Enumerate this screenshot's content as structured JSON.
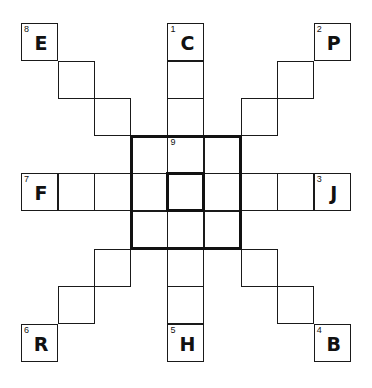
{
  "puzzle": {
    "type": "word-star grid",
    "grid_size": 9,
    "cells": [
      {
        "r": 0,
        "c": 0,
        "num": "8",
        "letter": "E"
      },
      {
        "r": 1,
        "c": 1
      },
      {
        "r": 2,
        "c": 2
      },
      {
        "r": 0,
        "c": 8,
        "num": "2",
        "letter": "P"
      },
      {
        "r": 1,
        "c": 7
      },
      {
        "r": 2,
        "c": 6
      },
      {
        "r": 6,
        "c": 2
      },
      {
        "r": 7,
        "c": 1
      },
      {
        "r": 8,
        "c": 0,
        "num": "6",
        "letter": "R"
      },
      {
        "r": 6,
        "c": 6
      },
      {
        "r": 7,
        "c": 7
      },
      {
        "r": 8,
        "c": 8,
        "num": "4",
        "letter": "B"
      },
      {
        "r": 0,
        "c": 4,
        "num": "1",
        "letter": "C"
      },
      {
        "r": 1,
        "c": 4
      },
      {
        "r": 2,
        "c": 4
      },
      {
        "r": 3,
        "c": 4,
        "num": "9"
      },
      {
        "r": 4,
        "c": 4
      },
      {
        "r": 5,
        "c": 4
      },
      {
        "r": 6,
        "c": 4
      },
      {
        "r": 7,
        "c": 4
      },
      {
        "r": 8,
        "c": 4,
        "num": "5",
        "letter": "H"
      },
      {
        "r": 4,
        "c": 0,
        "num": "7",
        "letter": "F"
      },
      {
        "r": 4,
        "c": 1
      },
      {
        "r": 4,
        "c": 2
      },
      {
        "r": 4,
        "c": 3
      },
      {
        "r": 4,
        "c": 5
      },
      {
        "r": 4,
        "c": 6
      },
      {
        "r": 4,
        "c": 7
      },
      {
        "r": 4,
        "c": 8,
        "num": "3",
        "letter": "J"
      },
      {
        "r": 3,
        "c": 3
      },
      {
        "r": 3,
        "c": 5
      },
      {
        "r": 5,
        "c": 3
      },
      {
        "r": 5,
        "c": 5
      }
    ],
    "thick_regions": [
      {
        "name": "center-3x3-box",
        "r": 3,
        "c": 3,
        "rows": 3,
        "cols": 3
      },
      {
        "name": "center-cell-box",
        "r": 4,
        "c": 4,
        "rows": 1,
        "cols": 1
      }
    ]
  }
}
